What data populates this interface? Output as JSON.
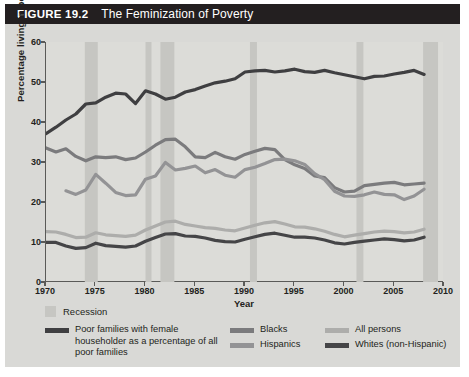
{
  "header": {
    "figure_number": "FIGURE 19.2",
    "title": "The Feminization of Poverty",
    "bar_color": "#231f20"
  },
  "axes": {
    "ylabel": "Percentage living in poverty",
    "xlabel": "Year",
    "yticks": [
      "0",
      "10",
      "20",
      "30",
      "40",
      "50",
      "60"
    ],
    "xticks": [
      "1970",
      "1975",
      "1980",
      "1985",
      "1990",
      "1995",
      "2000",
      "2005",
      "2010"
    ]
  },
  "legend": {
    "recession_label": "Recession",
    "recession_color": "#c6c6c2",
    "entries": [
      {
        "label": "Poor families with female householder as a percentage of all poor families",
        "color": "#3f3f41",
        "column": 1
      },
      {
        "label": "Blacks",
        "color": "#7b7b7d",
        "column": 2
      },
      {
        "label": "Hispanics",
        "color": "#939395",
        "column": 2
      },
      {
        "label": "All persons",
        "color": "#adadab",
        "column": 3
      },
      {
        "label": "Whites (non-Hispanic)",
        "color": "#454547",
        "column": 3
      }
    ]
  },
  "chart_data": {
    "type": "line",
    "title": "The Feminization of Poverty",
    "xlabel": "Year",
    "ylabel": "Percentage living in poverty",
    "xlim": [
      1970,
      2010
    ],
    "ylim": [
      0,
      60
    ],
    "grid": false,
    "legend_position": "below",
    "recessions": [
      {
        "start": 1973.9,
        "end": 1975.2
      },
      {
        "start": 1980.0,
        "end": 1980.6
      },
      {
        "start": 1981.5,
        "end": 1982.9
      },
      {
        "start": 1990.5,
        "end": 1991.2
      },
      {
        "start": 2001.2,
        "end": 2001.9
      },
      {
        "start": 2007.9,
        "end": 2009.4
      }
    ],
    "x": [
      1970,
      1971,
      1972,
      1973,
      1974,
      1975,
      1976,
      1977,
      1978,
      1979,
      1980,
      1981,
      1982,
      1983,
      1984,
      1985,
      1986,
      1987,
      1988,
      1989,
      1990,
      1991,
      1992,
      1993,
      1994,
      1995,
      1996,
      1997,
      1998,
      1999,
      2000,
      2001,
      2002,
      2003,
      2004,
      2005,
      2006,
      2007,
      2008
    ],
    "series": [
      {
        "name": "Poor families with female householder as a percentage of all poor families",
        "color": "#3f3f41",
        "width": 3.2,
        "values": [
          37.1,
          38.7,
          40.5,
          42.0,
          44.5,
          44.8,
          46.2,
          47.2,
          47.0,
          44.6,
          47.8,
          47.0,
          45.7,
          46.2,
          47.5,
          48.1,
          49.0,
          49.8,
          50.2,
          50.8,
          52.5,
          52.8,
          52.9,
          52.5,
          52.8,
          53.2,
          52.6,
          52.4,
          52.9,
          52.3,
          51.8,
          51.3,
          50.8,
          51.4,
          51.5,
          52.0,
          52.4,
          52.9,
          51.9
        ]
      },
      {
        "name": "Blacks",
        "color": "#7b7b7d",
        "width": 3.2,
        "values": [
          33.5,
          32.5,
          33.3,
          31.4,
          30.3,
          31.3,
          31.1,
          31.3,
          30.6,
          31.0,
          32.5,
          34.2,
          35.6,
          35.7,
          33.8,
          31.3,
          31.1,
          32.4,
          31.3,
          30.7,
          31.9,
          32.7,
          33.4,
          33.1,
          30.6,
          29.3,
          28.4,
          26.5,
          26.1,
          23.6,
          22.5,
          22.7,
          24.1,
          24.4,
          24.7,
          24.9,
          24.3,
          24.5,
          24.7
        ]
      },
      {
        "name": "Hispanics",
        "color": "#939395",
        "width": 3.2,
        "values": [
          null,
          null,
          22.8,
          21.9,
          23.0,
          26.9,
          24.7,
          22.4,
          21.6,
          21.8,
          25.7,
          26.5,
          29.9,
          28.0,
          28.4,
          29.0,
          27.3,
          28.1,
          26.7,
          26.2,
          28.1,
          28.7,
          29.6,
          30.6,
          30.7,
          30.3,
          29.4,
          27.1,
          25.6,
          22.7,
          21.5,
          21.4,
          21.8,
          22.5,
          21.9,
          21.8,
          20.6,
          21.5,
          23.2
        ]
      },
      {
        "name": "All persons",
        "color": "#adadab",
        "width": 3.2,
        "values": [
          12.6,
          12.5,
          11.9,
          11.1,
          11.2,
          12.3,
          11.8,
          11.6,
          11.4,
          11.7,
          13.0,
          14.0,
          15.0,
          15.2,
          14.4,
          14.0,
          13.6,
          13.4,
          13.0,
          12.8,
          13.5,
          14.2,
          14.8,
          15.1,
          14.5,
          13.8,
          13.7,
          13.3,
          12.7,
          11.9,
          11.3,
          11.7,
          12.1,
          12.5,
          12.7,
          12.6,
          12.3,
          12.5,
          13.2
        ]
      },
      {
        "name": "Whites (non-Hispanic)",
        "color": "#454547",
        "width": 3.2,
        "values": [
          9.9,
          9.9,
          9.0,
          8.4,
          8.6,
          9.7,
          9.1,
          8.9,
          8.7,
          9.0,
          10.2,
          11.1,
          12.0,
          12.1,
          11.5,
          11.4,
          11.0,
          10.4,
          10.1,
          10.0,
          10.7,
          11.3,
          11.9,
          12.2,
          11.7,
          11.2,
          11.2,
          11.0,
          10.5,
          9.8,
          9.5,
          9.9,
          10.2,
          10.5,
          10.8,
          10.6,
          10.3,
          10.5,
          11.2
        ]
      }
    ]
  }
}
